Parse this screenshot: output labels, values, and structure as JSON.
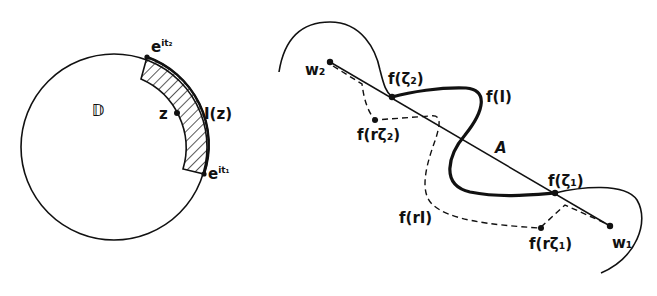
{
  "figure": {
    "left_panel": {
      "disk_label": "𝔻",
      "point_label": "z",
      "arc_label": "I(z)",
      "endpoint_top": {
        "base": "e",
        "exp": "it₂"
      },
      "endpoint_bottom": {
        "base": "e",
        "exp": "it₁"
      }
    },
    "right_panel": {
      "w2_label": "w₂",
      "w1_label": "w₁",
      "f_zeta2_label": "f(ζ₂)",
      "f_zeta1_label": "f(ζ₁)",
      "f_I_label": "f(I)",
      "f_r_zeta2_label": "f(rζ₂)",
      "f_r_zeta1_label": "f(rζ₁)",
      "f_rI_label": "f(rI)",
      "segment_label": "A"
    },
    "colors": {
      "ink": "#111111",
      "background": "#ffffff"
    }
  }
}
